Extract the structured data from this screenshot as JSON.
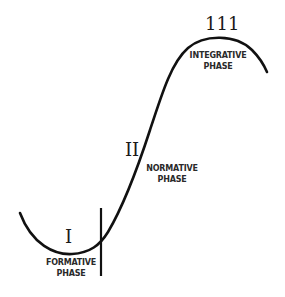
{
  "diagram": {
    "type": "phase-curve",
    "stroke_color": "#111111",
    "phases": [
      {
        "numeral": "I",
        "label_line1": "FORMATIVE",
        "label_line2": "PHASE"
      },
      {
        "numeral": "II",
        "label_line1": "NORMATIVE",
        "label_line2": "PHASE"
      },
      {
        "numeral": "111",
        "label_line1": "INTEGRATIVE",
        "label_line2": "PHASE"
      }
    ]
  }
}
